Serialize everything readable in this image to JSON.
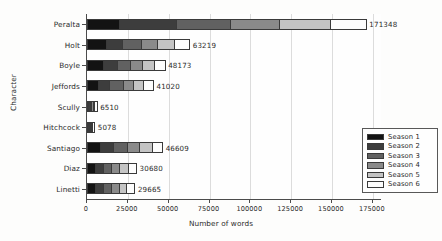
{
  "chart_data": {
    "type": "bar",
    "orientation": "horizontal",
    "stacked": true,
    "title": "",
    "xlabel": "Number of words",
    "ylabel": "Character",
    "xlim": [
      0,
      180000
    ],
    "xticks": [
      0,
      25000,
      50000,
      75000,
      100000,
      125000,
      150000,
      175000
    ],
    "xtick_labels": [
      "0",
      "25000",
      "50000",
      "75000",
      "100000",
      "125000",
      "150000",
      "175000"
    ],
    "grid": true,
    "grid_axis": "x",
    "legend_position": "lower right",
    "categories": [
      "Peralta",
      "Holt",
      "Boyle",
      "Jeffords",
      "Scully",
      "Hitchcock",
      "Santiago",
      "Diaz",
      "Linetti"
    ],
    "totals": [
      171348,
      63219,
      48173,
      41020,
      6510,
      5078,
      46609,
      30680,
      29665
    ],
    "total_labels": [
      "171348",
      "63219",
      "48173",
      "41020",
      "6510",
      "5078",
      "46609",
      "30680",
      "29665"
    ],
    "series": [
      {
        "name": "Season 1",
        "color": "#131313",
        "values": [
          19500,
          11600,
          9800,
          6700,
          1050,
          900,
          8300,
          4900,
          5300
        ]
      },
      {
        "name": "Season 2",
        "color": "#3d3d3d",
        "values": [
          35500,
          10400,
          8900,
          7500,
          1150,
          950,
          8100,
          5500,
          5100
        ]
      },
      {
        "name": "Season 3",
        "color": "#616161",
        "values": [
          33500,
          11800,
          8200,
          8600,
          1100,
          800,
          8500,
          5200,
          5000
        ]
      },
      {
        "name": "Season 4",
        "color": "#8a8a8a",
        "values": [
          30200,
          10100,
          7400,
          6200,
          1050,
          900,
          8000,
          5100,
          4800
        ]
      },
      {
        "name": "Season 5",
        "color": "#c4c4c4",
        "values": [
          31100,
          10300,
          7600,
          6100,
          1060,
          828,
          7900,
          5200,
          4800
        ]
      },
      {
        "name": "Season 6",
        "color": "#fdfdfd",
        "values": [
          21548,
          9019,
          6273,
          5920,
          1100,
          700,
          5809,
          4780,
          4665
        ]
      }
    ]
  },
  "legend": {
    "items": [
      {
        "label": "Season 1"
      },
      {
        "label": "Season 2"
      },
      {
        "label": "Season 3"
      },
      {
        "label": "Season 4"
      },
      {
        "label": "Season 5"
      },
      {
        "label": "Season 6"
      }
    ]
  }
}
